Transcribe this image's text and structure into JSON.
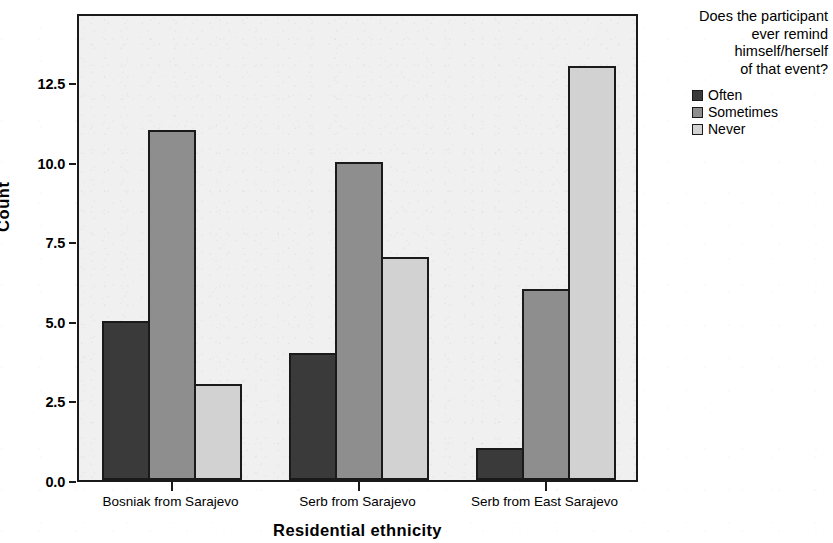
{
  "chart_data": {
    "type": "bar",
    "title": "",
    "xlabel": "Residential ethnicity",
    "ylabel": "Count",
    "categories": [
      "Bosniak from Sarajevo",
      "Serb from Sarajevo",
      "Serb from East Sarajevo"
    ],
    "series": [
      {
        "name": "Often",
        "values": [
          5,
          4,
          1
        ],
        "color": "#3a3a3a"
      },
      {
        "name": "Sometimes",
        "values": [
          11,
          10,
          6
        ],
        "color": "#8e8e8e"
      },
      {
        "name": "Never",
        "values": [
          3,
          7,
          13
        ],
        "color": "#d2d2d2"
      }
    ],
    "ylim": [
      0,
      14.7
    ],
    "ytick_labels": [
      "0.0",
      "2.5",
      "5.0",
      "7.5",
      "10.0",
      "12.5"
    ],
    "ytick_values": [
      0,
      2.5,
      5,
      7.5,
      10,
      12.5
    ],
    "grid": false,
    "legend_position": "right",
    "legend_title": "Does the participant\never remind\nhimself/herself\nof that event?",
    "legend_entries": [
      "Often",
      "Sometimes",
      "Never"
    ],
    "plot_background": "#f0f0f0",
    "axis_color": "#1a1a1a"
  },
  "axes": {
    "y_title": "Count",
    "x_title": "Residential ethnicity"
  },
  "legend": {
    "title": "Does the participant\never remind\nhimself/herself\nof that event?"
  }
}
